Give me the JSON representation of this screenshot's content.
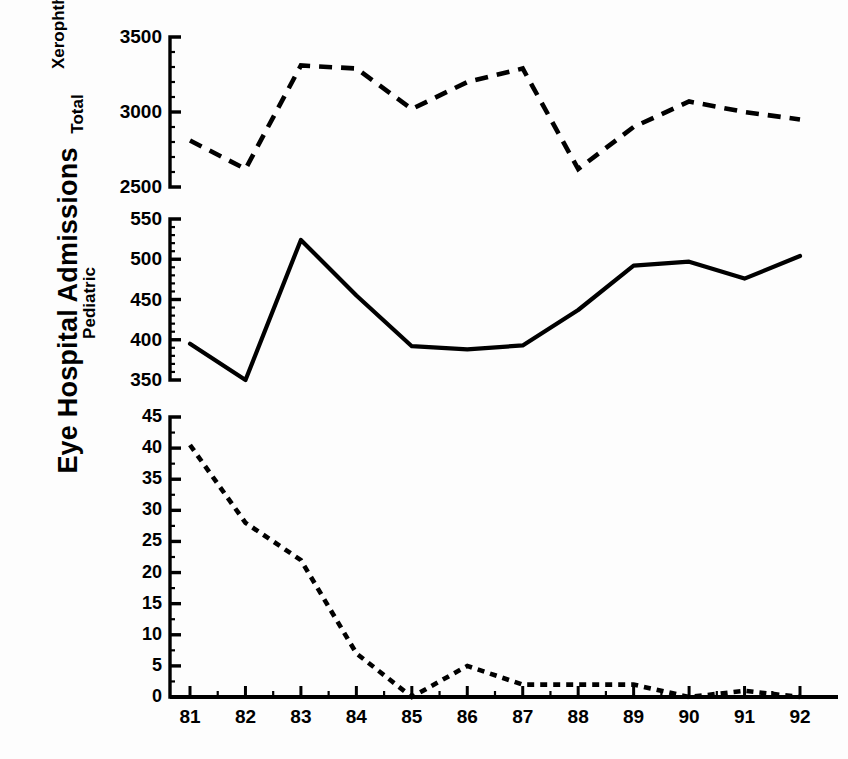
{
  "figure": {
    "main_ylabel": "Eye Hospital Admissions",
    "width": 848,
    "height": 759,
    "line_color": "#000000",
    "background": "#ffffff"
  },
  "chart_data": [
    {
      "type": "line",
      "panel": "top",
      "title": "",
      "ylabel": "Total",
      "xlabel": "",
      "linestyle": "dashed",
      "grid": false,
      "legend": "none",
      "categories": [
        "81",
        "82",
        "83",
        "84",
        "85",
        "86",
        "87",
        "88",
        "89",
        "90",
        "91",
        "92"
      ],
      "x": [
        81,
        82,
        83,
        84,
        85,
        86,
        87,
        88,
        89,
        90,
        91,
        92
      ],
      "values": [
        2810,
        2620,
        3310,
        3290,
        3020,
        3200,
        3290,
        2620,
        2900,
        3070,
        3000,
        2950
      ],
      "ylim": [
        2500,
        3500
      ],
      "yticks": [
        2500,
        3000,
        3500
      ],
      "ytick_labels": [
        "2500",
        "3000",
        "3500"
      ],
      "yminor_step": 100
    },
    {
      "type": "line",
      "panel": "middle",
      "title": "",
      "ylabel": "Pediatric",
      "xlabel": "",
      "linestyle": "solid",
      "grid": false,
      "legend": "none",
      "categories": [
        "81",
        "82",
        "83",
        "84",
        "85",
        "86",
        "87",
        "88",
        "89",
        "90",
        "91",
        "92"
      ],
      "x": [
        81,
        82,
        83,
        84,
        85,
        86,
        87,
        88,
        89,
        90,
        91,
        92
      ],
      "values": [
        395,
        350,
        524,
        455,
        392,
        388,
        393,
        437,
        492,
        497,
        476,
        504
      ],
      "ylim": [
        350,
        550
      ],
      "yticks": [
        350,
        400,
        450,
        500,
        550
      ],
      "ytick_labels": [
        "350",
        "400",
        "450",
        "500",
        "550"
      ],
      "yminor_step": 10
    },
    {
      "type": "line",
      "panel": "bottom",
      "title": "",
      "ylabel": "Xerophthalmia",
      "xlabel": "",
      "linestyle": "dotted",
      "grid": false,
      "legend": "none",
      "categories": [
        "81",
        "82",
        "83",
        "84",
        "85",
        "86",
        "87",
        "88",
        "89",
        "90",
        "91",
        "92"
      ],
      "x": [
        81,
        82,
        83,
        84,
        85,
        86,
        87,
        88,
        89,
        90,
        91,
        92
      ],
      "values": [
        40.5,
        28,
        22,
        7,
        0,
        5,
        2,
        2,
        2,
        0,
        1,
        0
      ],
      "ylim": [
        0,
        45
      ],
      "yticks": [
        0,
        5,
        10,
        15,
        20,
        25,
        30,
        35,
        40,
        45
      ],
      "ytick_labels": [
        "0",
        "5",
        "10",
        "15",
        "20",
        "25",
        "30",
        "35",
        "40",
        "45"
      ],
      "yminor_step": 2.5
    }
  ],
  "xaxis": {
    "tick_labels": [
      "81",
      "82",
      "83",
      "84",
      "85",
      "86",
      "87",
      "88",
      "89",
      "90",
      "91",
      "92"
    ]
  }
}
